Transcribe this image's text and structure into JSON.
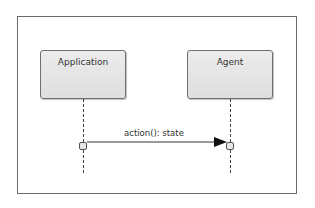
{
  "diagram": {
    "type": "sequence",
    "lifelines": [
      {
        "name": "Application"
      },
      {
        "name": "Agent"
      }
    ],
    "messages": [
      {
        "from": "Application",
        "to": "Agent",
        "label": "action(): state"
      }
    ]
  },
  "colors": {
    "frame_border": "#6a6a6a",
    "box_fill": "#e4e4e4",
    "box_border": "#6f6f6f",
    "text": "#333333",
    "line": "#444444"
  }
}
